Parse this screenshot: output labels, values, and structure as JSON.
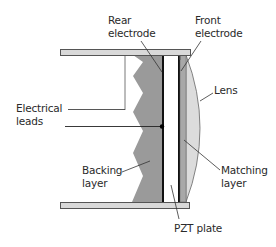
{
  "diagram": {
    "labels": {
      "rear_electrode": "Rear\nelectrode",
      "front_electrode": "Front\nelectrode",
      "lens": "Lens",
      "electrical_leads": "Electrical\nleads",
      "backing_layer": "Backing\nlayer",
      "matching_layer": "Matching\nlayer",
      "pzt_plate": "PZT plate"
    },
    "components": [
      "Housing (top bar)",
      "Housing (bottom bar)",
      "Backing layer",
      "Rear electrode",
      "PZT plate",
      "Front electrode",
      "Matching layer",
      "Lens",
      "Electrical leads"
    ],
    "colors": {
      "housing": "#d9d9d9",
      "backing": "#9a9a9a",
      "electrode": "#111111",
      "pzt": "#ffffff",
      "matching": "#a8a8a8",
      "lens": "#dcdcdc",
      "outline": "#555555",
      "leader": "#333333"
    }
  }
}
